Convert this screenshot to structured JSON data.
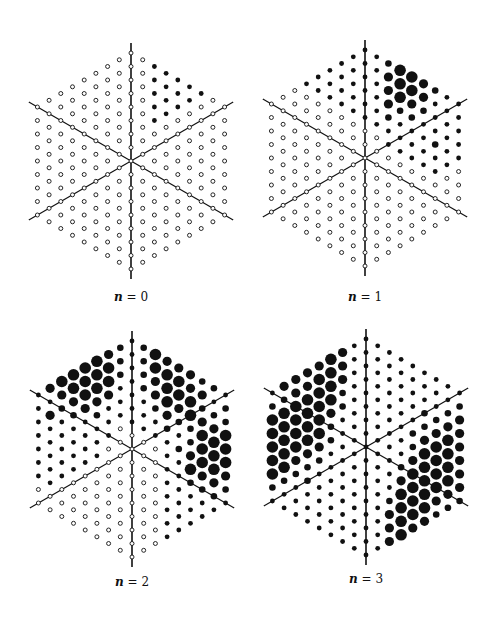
{
  "figure": {
    "lattice": {
      "radius": 8,
      "spacing_x": 11.7,
      "spacing_y": 13.5
    },
    "colors": {
      "ink": "#111111",
      "open_fill": "#ffffff",
      "background": "#ffffff"
    },
    "dot_codes": {
      "o": "open circle",
      "s": "small filled",
      "m": "medium filled",
      "L": "large filled",
      "X": "extra large filled"
    },
    "panels": [
      {
        "id": "n0",
        "caption_var": "n",
        "caption_eq": " = 0",
        "center": [
          131,
          161
        ],
        "caption_pos": [
          131,
          298
        ],
        "default_code": "o",
        "filled": [
          {
            "c": 2,
            "from_top": 0,
            "count": 5,
            "code": "s"
          },
          {
            "c": 3,
            "from_top": 0,
            "count": 4,
            "code": "s"
          },
          {
            "c": 4,
            "from_top": 0,
            "count": 3,
            "code": "s"
          },
          {
            "c": 5,
            "from_top": 0,
            "count": 2,
            "code": "s"
          },
          {
            "c": 6,
            "from_top": 0,
            "count": 1,
            "code": "s"
          }
        ]
      },
      {
        "id": "n1",
        "caption_var": "n",
        "caption_eq": " = 1",
        "center": [
          365,
          158
        ],
        "caption_pos": [
          365,
          298
        ],
        "default_code": "o",
        "filled": [
          {
            "c": -5,
            "from_top": 0,
            "count": 1,
            "code": "s"
          },
          {
            "c": -4,
            "from_top": 0,
            "count": 2,
            "code": "s"
          },
          {
            "c": -3,
            "from_top": 0,
            "count": 3,
            "code": "s"
          },
          {
            "c": -2,
            "from_top": 0,
            "count": 4,
            "code": "s"
          },
          {
            "c": -1,
            "from_top": 0,
            "count": 5,
            "code": "s"
          },
          {
            "c": 0,
            "from_top": 0,
            "count": 6,
            "code": "s"
          },
          {
            "c": 1,
            "from_top": 0,
            "count": 6,
            "code": "s"
          },
          {
            "c": 2,
            "from_top": 0,
            "count": 7,
            "sizes": "mLLLmss"
          },
          {
            "c": 3,
            "from_top": 0,
            "count": 7,
            "sizes": "XXXmsss"
          },
          {
            "c": 4,
            "from_top": 0,
            "count": 7,
            "sizes": "XXLmsss"
          },
          {
            "c": 5,
            "from_top": 0,
            "count": 7,
            "sizes": "LLmssss"
          },
          {
            "c": 6,
            "from_top": 0,
            "count": 7,
            "sizes": "msssmss"
          },
          {
            "c": 7,
            "from_top": 0,
            "count": 6,
            "sizes": "ssssss"
          },
          {
            "c": 8,
            "from_top": 0,
            "count": 5,
            "sizes": "sssss"
          }
        ]
      },
      {
        "id": "n2",
        "caption_var": "n",
        "caption_eq": " = 2",
        "center": [
          132,
          449
        ],
        "caption_pos": [
          132,
          583
        ],
        "default_code": "o",
        "filled": [
          {
            "c": -8,
            "from_top": 0,
            "count": 7,
            "code": "s"
          },
          {
            "c": -7,
            "from_top": 0,
            "count": 8,
            "sizes": "LsLssssss"
          },
          {
            "c": -6,
            "from_top": 0,
            "count": 8,
            "sizes": "XLmsssss"
          },
          {
            "c": -5,
            "from_top": 0,
            "count": 8,
            "sizes": "XXLmssss"
          },
          {
            "c": -4,
            "from_top": 0,
            "count": 8,
            "sizes": "XXXLssss"
          },
          {
            "c": -3,
            "from_top": 0,
            "count": 8,
            "sizes": "XXXLmsss"
          },
          {
            "c": -2,
            "from_top": 0,
            "count": 7,
            "sizes": "LXXLsss"
          },
          {
            "c": -1,
            "from_top": 0,
            "count": 6,
            "sizes": "mmmsss"
          },
          {
            "c": 0,
            "from_top": 0,
            "count": 7,
            "code": "s"
          },
          {
            "c": 1,
            "from_top": 0,
            "count": 7,
            "sizes": "mmmmsss"
          },
          {
            "c": 2,
            "from_top": 0,
            "count": 7,
            "sizes": "XXLLmss"
          },
          {
            "c": 3,
            "from_top": 0,
            "count": 16,
            "sizes": "LXXXLmssssssssss"
          },
          {
            "c": 4,
            "from_top": 0,
            "count": 15,
            "sizes": "LXXLmsmsssssssss"
          },
          {
            "c": 5,
            "from_top": 0,
            "count": 14,
            "sizes": "LLXXmmLXmsssss"
          },
          {
            "c": 6,
            "from_top": 0,
            "count": 13,
            "sizes": "mLmLXXXLmssss"
          },
          {
            "c": 7,
            "from_top": 0,
            "count": 12,
            "sizes": "msmLXXXLmsss"
          },
          {
            "c": 8,
            "from_top": 0,
            "count": 9,
            "sizes": "smmXXXLms"
          }
        ]
      },
      {
        "id": "n3",
        "caption_var": "n",
        "caption_eq": " = 3",
        "center": [
          366,
          447
        ],
        "caption_pos": [
          366,
          580
        ],
        "default_code": "s",
        "filled": [
          {
            "c": -8,
            "from_top": 0,
            "count": 9,
            "sizes": "smXXXXXms"
          },
          {
            "c": -7,
            "from_top": 0,
            "count": 10,
            "sizes": "LmXXXXXmss"
          },
          {
            "c": -6,
            "from_top": 0,
            "count": 11,
            "sizes": "LLXXXXLmsss"
          },
          {
            "c": -5,
            "from_top": 0,
            "count": 12,
            "sizes": "LLXXXXLmmsss"
          },
          {
            "c": -4,
            "from_top": 0,
            "count": 12,
            "sizes": "LXXXXXLmssss"
          },
          {
            "c": -3,
            "from_top": 0,
            "count": 12,
            "sizes": "XXXXLmmsssss"
          },
          {
            "c": -2,
            "from_top": 0,
            "count": 8,
            "sizes": "LLLmmsss"
          },
          {
            "c": 2,
            "from_top": 6,
            "count": 10,
            "sizes": "sssssmLLLL"
          },
          {
            "c": 3,
            "from_top": 5,
            "count": 10,
            "sizes": "sssmLXXXXL"
          },
          {
            "c": 4,
            "from_top": 4,
            "count": 9,
            "sizes": "smmLXXXXL"
          },
          {
            "c": 5,
            "from_top": 3,
            "count": 9,
            "sizes": "mmLXXXXXL"
          },
          {
            "c": 6,
            "from_top": 2,
            "count": 9,
            "sizes": "smLXXXXLm"
          },
          {
            "c": 7,
            "from_top": 1,
            "count": 9,
            "sizes": "smLXXXXLm"
          },
          {
            "c": 8,
            "from_top": 1,
            "count": 8,
            "sizes": "mLLLLLLm"
          }
        ]
      }
    ]
  }
}
